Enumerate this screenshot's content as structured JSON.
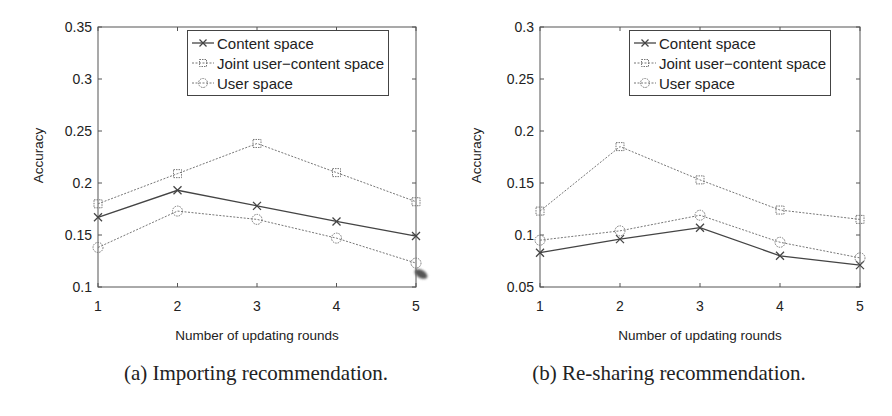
{
  "chart_data": [
    {
      "type": "line",
      "title": "",
      "caption": "(a) Importing recommendation.",
      "xlabel": "Number of updating rounds",
      "ylabel": "Accuracy",
      "x": [
        1,
        2,
        3,
        4,
        5
      ],
      "xticks": [
        "1",
        "2",
        "3",
        "4",
        "5"
      ],
      "ylim": [
        0.1,
        0.35
      ],
      "yticks": [
        "0.1",
        "0.15",
        "0.2",
        "0.25",
        "0.3",
        "0.35"
      ],
      "grid": false,
      "legend_position": "upper right",
      "series": [
        {
          "name": "Content space",
          "marker": "x",
          "line": "solid",
          "color": "#444444",
          "values": [
            0.167,
            0.193,
            0.178,
            0.163,
            0.149
          ]
        },
        {
          "name": "Joint user−content space",
          "marker": "square",
          "line": "dotted",
          "color": "#777777",
          "values": [
            0.18,
            0.209,
            0.238,
            0.21,
            0.182
          ]
        },
        {
          "name": "User space",
          "marker": "circle",
          "line": "dotted",
          "color": "#777777",
          "values": [
            0.138,
            0.173,
            0.165,
            0.147,
            0.123
          ]
        }
      ]
    },
    {
      "type": "line",
      "title": "",
      "caption": "(b) Re-sharing recommendation.",
      "xlabel": "Number of updating rounds",
      "ylabel": "Accuracy",
      "x": [
        1,
        2,
        3,
        4,
        5
      ],
      "xticks": [
        "1",
        "2",
        "3",
        "4",
        "5"
      ],
      "ylim": [
        0.05,
        0.3
      ],
      "yticks": [
        "0.05",
        "0.1",
        "0.15",
        "0.2",
        "0.25",
        "0.3"
      ],
      "grid": false,
      "legend_position": "upper right",
      "series": [
        {
          "name": "Content space",
          "marker": "x",
          "line": "solid",
          "color": "#444444",
          "values": [
            0.083,
            0.096,
            0.107,
            0.08,
            0.071
          ]
        },
        {
          "name": "Joint user−content space",
          "marker": "square",
          "line": "dotted",
          "color": "#777777",
          "values": [
            0.123,
            0.185,
            0.153,
            0.124,
            0.115
          ]
        },
        {
          "name": "User space",
          "marker": "circle",
          "line": "dotted",
          "color": "#777777",
          "values": [
            0.095,
            0.104,
            0.119,
            0.093,
            0.078
          ]
        }
      ]
    }
  ]
}
